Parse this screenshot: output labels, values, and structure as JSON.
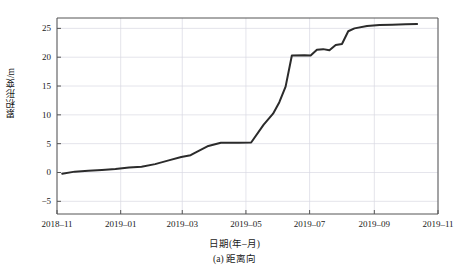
{
  "chart_data": {
    "type": "line",
    "title": "",
    "caption": "(a) 距离向",
    "xlabel": "日期(年–月)",
    "ylabel": "累积形变/m",
    "xtick_labels": [
      "2018–11",
      "2019–01",
      "2019–03",
      "2019–05",
      "2019–07",
      "2019–09",
      "2019–11"
    ],
    "ytick_labels": [
      "-5",
      "0",
      "5",
      "10",
      "15",
      "20",
      "25"
    ],
    "ytick_values": [
      -5,
      0,
      5,
      10,
      15,
      20,
      25
    ],
    "ylim": [
      -7.2,
      26.8
    ],
    "xlim": [
      "2018-11-01",
      "2019-11-01"
    ],
    "grid": true,
    "legend": null,
    "line_color": "#2b2b2b",
    "grid_color": "#d8d8e2",
    "axis_color": "#555555",
    "series": [
      {
        "name": "累积形变",
        "x": [
          "2018-11-06",
          "2018-11-18",
          "2018-12-01",
          "2018-12-14",
          "2018-12-27",
          "2019-01-09",
          "2019-01-21",
          "2019-02-03",
          "2019-02-16",
          "2019-02-28",
          "2019-03-09",
          "2019-03-14",
          "2019-03-26",
          "2019-04-07",
          "2019-04-14",
          "2019-04-24",
          "2019-05-06",
          "2019-05-18",
          "2019-05-27",
          "2019-06-02",
          "2019-06-08",
          "2019-06-14",
          "2019-06-26",
          "2019-07-02",
          "2019-07-08",
          "2019-07-14",
          "2019-07-20",
          "2019-07-26",
          "2019-08-01",
          "2019-08-07",
          "2019-08-13",
          "2019-08-25",
          "2019-09-06",
          "2019-09-18",
          "2019-10-01",
          "2019-10-12"
        ],
        "y": [
          -0.2,
          0.15,
          0.3,
          0.45,
          0.6,
          0.85,
          1.0,
          1.45,
          2.1,
          2.7,
          3.0,
          3.5,
          4.6,
          5.15,
          5.15,
          5.15,
          5.2,
          8.3,
          10.2,
          12.2,
          14.9,
          20.3,
          20.35,
          20.3,
          21.3,
          21.4,
          21.2,
          22.1,
          22.3,
          24.5,
          25.0,
          25.4,
          25.6,
          25.65,
          25.7,
          25.75
        ]
      }
    ]
  },
  "plot_geometry": {
    "left": 57,
    "right": 438,
    "top": 18,
    "bottom": 214
  }
}
